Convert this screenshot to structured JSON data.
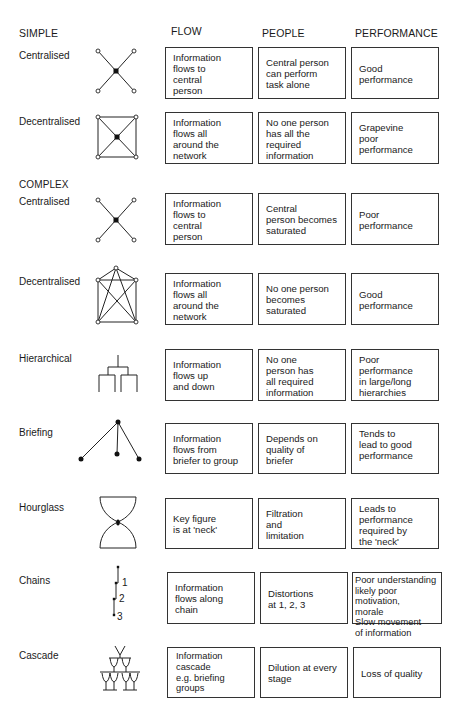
{
  "headers": {
    "simple": "SIMPLE",
    "flow": "FLOW",
    "people": "PEOPLE",
    "performance": "PERFORMANCE",
    "complex": "COMPLEX"
  },
  "rows": [
    {
      "label": "Centralised",
      "icon": "star-network-icon",
      "flow": "Information\nflows to\ncentral\nperson",
      "people": "Central person\ncan perform\ntask alone",
      "performance": "Good\nperformance"
    },
    {
      "label": "Decentralised",
      "icon": "square-network-icon",
      "flow": "Information\nflows all\naround the\nnetwork",
      "people": "No one person\nhas all the\nrequired\ninformation",
      "performance": "Grapevine\npoor\nperformance"
    },
    {
      "label": "Centralised",
      "icon": "star-network-icon",
      "flow": "Information\nflows to\ncentral\nperson",
      "people": "Central\nperson becomes\nsaturated",
      "performance": "Poor\nperformance"
    },
    {
      "label": "Decentralised",
      "icon": "full-mesh-network-icon",
      "flow": "Information\nflows all\naround the\nnetwork",
      "people": "No one person\nbecomes\nsaturated",
      "performance": "Good\nperformance"
    },
    {
      "label": "Hierarchical",
      "icon": "hierarchy-tree-icon",
      "flow": "Information\nflows up\nand down",
      "people": "No one\nperson has\nall required\ninformation",
      "performance": "Poor\nperformance\nin large/long\nhierarchies"
    },
    {
      "label": "Briefing",
      "icon": "briefing-fan-icon",
      "flow": "Information\nflows from\nbriefer to group",
      "people": "Depends on\nquality of\nbriefer",
      "performance": "Tends to\nlead to good\nperformance"
    },
    {
      "label": "Hourglass",
      "icon": "hourglass-icon",
      "flow": "Key figure\nis at 'neck'",
      "people": "Filtration\nand\nlimitation",
      "performance": "Leads to\nperformance\nrequired by\nthe 'neck'"
    },
    {
      "label": "Chains",
      "icon": "chain-icon",
      "chain_numbers": [
        "1",
        "2",
        "3"
      ],
      "flow": "Information\nflows along\nchain",
      "people": "Distortions\nat 1, 2, 3",
      "performance": "Poor understanding\nlikely poor motivation,\nmorale\nSlow movement\nof information"
    },
    {
      "label": "Cascade",
      "icon": "glass-cascade-icon",
      "flow": "Information\ncascade\ne.g. briefing groups",
      "people": "Dilution at every\nstage",
      "performance": "Loss of quality"
    }
  ],
  "colors": {
    "ink": "#1a1a1a",
    "border": "#333333",
    "background": "#ffffff"
  }
}
